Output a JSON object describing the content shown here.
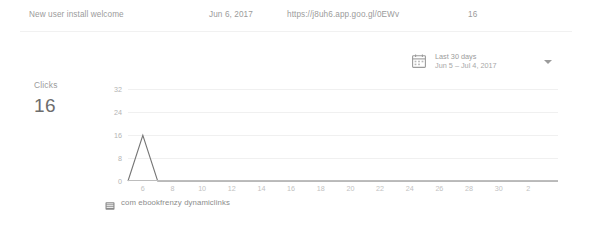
{
  "row": {
    "title": "New user install welcome",
    "date": "Jun 6, 2017",
    "url": "https://j8uh6.app.goo.gl/0EWv",
    "count": "16"
  },
  "date_range": {
    "icon": "calendar-icon",
    "label": "Last 30 days",
    "range": "Jun 5 – Jul 4, 2017",
    "caret": "chevron-down-icon"
  },
  "summary": {
    "label": "Clicks",
    "value": "16"
  },
  "legend": {
    "icon": "android-app-icon",
    "label": "com ebookfrenzy dynamiclinks"
  },
  "colors": {
    "line": "#757575",
    "grid": "#f0f0f0",
    "axis": "#bdbdbd",
    "text": "#9b9b9b",
    "tick": "#bdbdbd",
    "background": "#ffffff"
  },
  "chart_data": {
    "type": "line",
    "title": "",
    "xlabel": "",
    "ylabel": "Clicks",
    "ylim": [
      0,
      36
    ],
    "yticks": [
      0,
      8,
      16,
      24,
      32
    ],
    "ytick_labels": [
      "0",
      "8",
      "16",
      "24",
      "32"
    ],
    "xlim": [
      5,
      34
    ],
    "xticks": [
      6,
      8,
      10,
      12,
      14,
      16,
      18,
      20,
      22,
      24,
      26,
      28,
      30,
      32
    ],
    "xtick_labels": [
      "6",
      "8",
      "10",
      "12",
      "14",
      "16",
      "18",
      "20",
      "22",
      "24",
      "26",
      "28",
      "30",
      "2"
    ],
    "grid": true,
    "legend_position": "bottom-left",
    "series": [
      {
        "name": "com ebookfrenzy dynamiclinks",
        "x": [
          5,
          6,
          7,
          8,
          9,
          10,
          11,
          12,
          13,
          14,
          15,
          16,
          17,
          18,
          19,
          20,
          21,
          22,
          23,
          24,
          25,
          26,
          27,
          28,
          29,
          30,
          31,
          32,
          33,
          34
        ],
        "values": [
          0,
          16,
          0,
          0,
          0,
          0,
          0,
          0,
          0,
          0,
          0,
          0,
          0,
          0,
          0,
          0,
          0,
          0,
          0,
          0,
          0,
          0,
          0,
          0,
          0,
          0,
          0,
          0,
          0,
          0
        ]
      }
    ]
  }
}
